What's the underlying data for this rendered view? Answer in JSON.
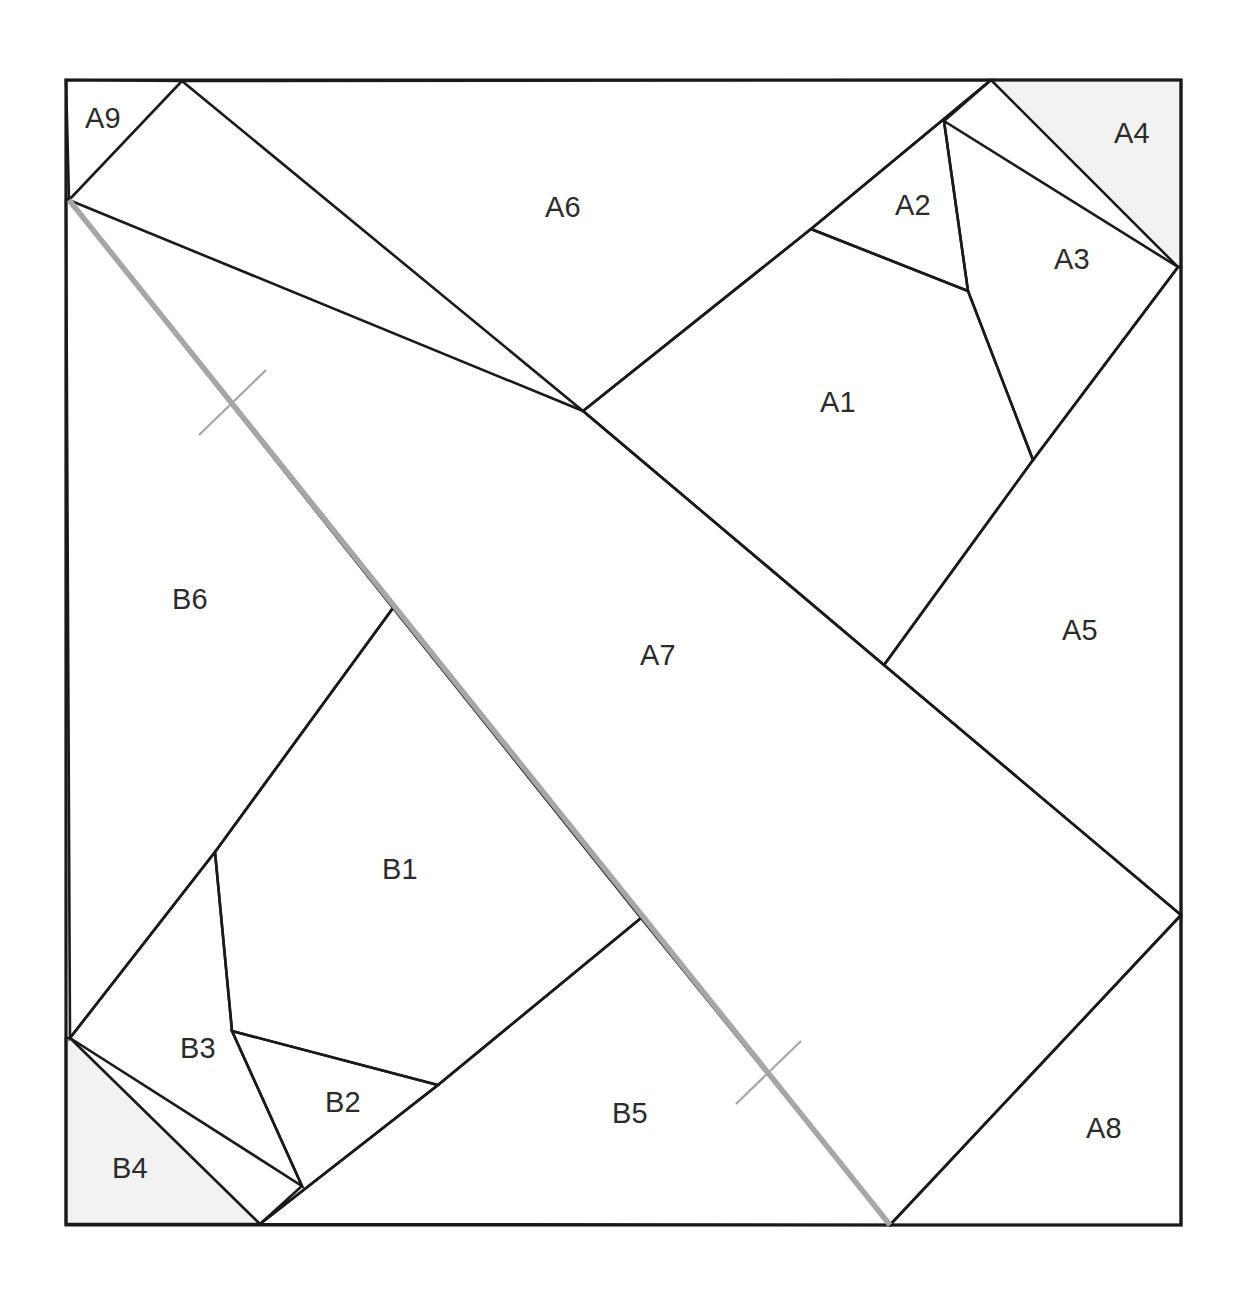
{
  "figure": {
    "canvas": {
      "width": 1251,
      "height": 1301
    },
    "frame": {
      "name": "outer-square",
      "points": "66,80 1181,80 1181,1225 66,1225",
      "stroke": "#1a1a1a"
    },
    "colors": {
      "edge": "#1a1a1a",
      "shaded_fill": "#f2f2f2",
      "plain_fill": "#ffffff",
      "cut_line": "#a6a6a6",
      "label_text": "#2b2b2b"
    },
    "cut_line": {
      "name": "gray-diagonal-cut",
      "from": {
        "x": 69,
        "y": 200
      },
      "to": {
        "x": 890,
        "y": 1225
      },
      "color": "#a6a6a6"
    },
    "tick_marks": [
      {
        "name": "tick-mark-upper",
        "points": "199,435 266,370"
      },
      {
        "name": "tick-mark-lower",
        "points": "736,1104 801,1041"
      }
    ],
    "pieces": [
      {
        "id": "A1",
        "label": "A1",
        "shaded": false,
        "label_pos": {
          "x": 838,
          "y": 404
        },
        "points": "583,411 811,229 968,291 1033,460 884,665"
      },
      {
        "id": "A2",
        "label": "A2",
        "shaded": false,
        "label_pos": {
          "x": 913,
          "y": 207
        },
        "points": "811,229 991,80 944,121 968,291"
      },
      {
        "id": "A3",
        "label": "A3",
        "shaded": false,
        "label_pos": {
          "x": 1072,
          "y": 261
        },
        "points": "944,121 1178,267 1033,460 968,291"
      },
      {
        "id": "A4",
        "label": "A4",
        "shaded": true,
        "label_pos": {
          "x": 1132,
          "y": 135
        },
        "points": "991,80 1181,80 1181,267 1178,267"
      },
      {
        "id": "A5",
        "label": "A5",
        "shaded": false,
        "label_pos": {
          "x": 1080,
          "y": 632
        },
        "points": "1033,460 1178,267 1181,267 1181,915 884,665"
      },
      {
        "id": "A6",
        "label": "A6",
        "shaded": false,
        "label_pos": {
          "x": 563,
          "y": 209
        },
        "points": "182,81 991,80 811,229 583,411"
      },
      {
        "id": "A7",
        "label": "A7",
        "shaded": false,
        "label_pos": {
          "x": 658,
          "y": 657
        },
        "points": "69,200 583,411 884,665 1181,915 890,1225 69,200"
      },
      {
        "id": "A8",
        "label": "A8",
        "shaded": false,
        "label_pos": {
          "x": 1104,
          "y": 1130
        },
        "points": "1181,915 1181,1225 890,1225"
      },
      {
        "id": "A9",
        "label": "A9",
        "shaded": false,
        "label_pos": {
          "x": 103,
          "y": 120
        },
        "points": "66,80 182,81 69,200 66,80"
      },
      {
        "id": "B1",
        "label": "B1",
        "shaded": false,
        "label_pos": {
          "x": 400,
          "y": 871
        },
        "points": "393,608 641,918 438,1085 232,1031 215,852"
      },
      {
        "id": "B2",
        "label": "B2",
        "shaded": false,
        "label_pos": {
          "x": 343,
          "y": 1104
        },
        "points": "232,1031 438,1085 260,1224 302,1186"
      },
      {
        "id": "B3",
        "label": "B3",
        "shaded": false,
        "label_pos": {
          "x": 198,
          "y": 1050
        },
        "points": "215,852 232,1031 302,1186 70,1038"
      },
      {
        "id": "B4",
        "label": "B4",
        "shaded": true,
        "label_pos": {
          "x": 130,
          "y": 1170
        },
        "points": "70,1038 260,1224 66,1224 66,1038"
      },
      {
        "id": "B5",
        "label": "B5",
        "shaded": false,
        "label_pos": {
          "x": 630,
          "y": 1115
        },
        "points": "641,918 890,1225 260,1224 438,1085"
      },
      {
        "id": "B6",
        "label": "B6",
        "shaded": false,
        "label_pos": {
          "x": 190,
          "y": 601
        },
        "points": "69,200 393,608 215,852 70,1038 66,200"
      }
    ]
  }
}
